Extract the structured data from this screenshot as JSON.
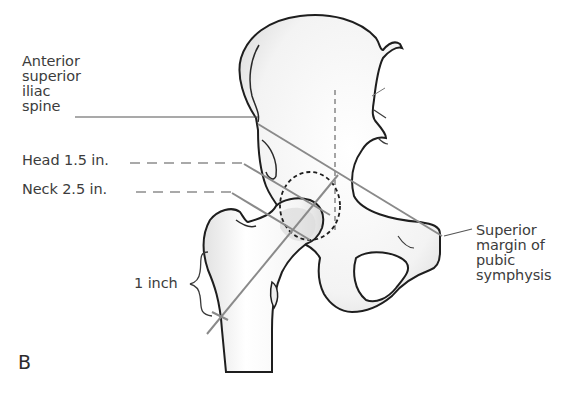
{
  "figure": {
    "panel_letter": "B",
    "labels": {
      "asis": "Anterior\nsuperior\niliac\nspine",
      "head": "Head 1.5 in.",
      "neck": "Neck 2.5 in.",
      "pubic": "Superior\nmargin of\npubic\nsymphysis",
      "inch": "1 inch"
    },
    "colors": {
      "outline": "#1e1e1e",
      "guide_line": "#8a8a8a",
      "leader_line": "#555555",
      "bone_fill": "#f7f7f7",
      "bone_shade": "#dedede",
      "text": "#3c3c3c"
    }
  }
}
